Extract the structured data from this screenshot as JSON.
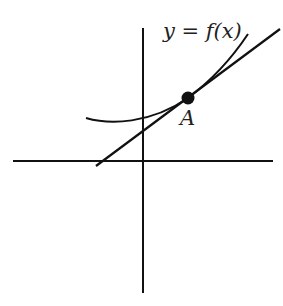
{
  "diagram": {
    "curve_label": "y = f(x)",
    "point_label": "A",
    "elements": [
      {
        "name": "x-axis",
        "type": "line"
      },
      {
        "name": "y-axis",
        "type": "line"
      },
      {
        "name": "curve",
        "type": "convex curve",
        "label": "y = f(x)"
      },
      {
        "name": "tangent-line",
        "type": "line",
        "tangent_at": "A"
      },
      {
        "name": "point-A",
        "type": "filled dot"
      }
    ],
    "colors": {
      "ink": "#111111",
      "background": "#ffffff"
    }
  }
}
